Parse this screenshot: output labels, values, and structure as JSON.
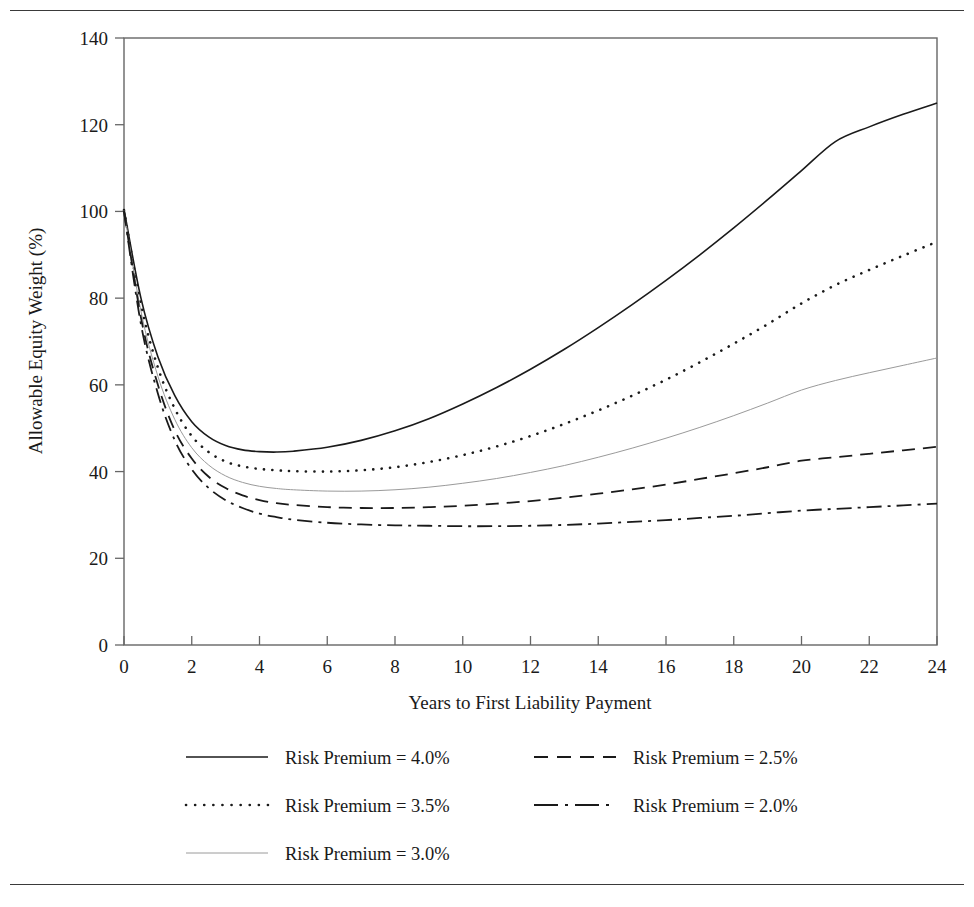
{
  "figure": {
    "background": "#ffffff",
    "frame_color": "#555555",
    "has_top_rule": true,
    "has_bottom_rule": true
  },
  "chart_data": {
    "type": "line",
    "title": "",
    "subtitle": "",
    "xlabel": "Years to First Liability Payment",
    "ylabel": "Allowable Equity Weight (%)",
    "xlim": [
      0,
      24
    ],
    "ylim": [
      0,
      140
    ],
    "xticks": [
      0,
      2,
      4,
      6,
      8,
      10,
      12,
      14,
      16,
      18,
      20,
      22,
      24
    ],
    "yticks": [
      0,
      20,
      40,
      60,
      80,
      100,
      120,
      140
    ],
    "xtick_labels": [
      "0",
      "2",
      "4",
      "6",
      "8",
      "10",
      "12",
      "14",
      "16",
      "18",
      "20",
      "22",
      "24"
    ],
    "ytick_labels": [
      "0",
      "20",
      "40",
      "60",
      "80",
      "100",
      "120",
      "140"
    ],
    "grid": false,
    "legend_position": "below-axes",
    "x": [
      0,
      0.5,
      1,
      1.5,
      2,
      2.5,
      3,
      3.5,
      4,
      4.5,
      5,
      6,
      7,
      8,
      9,
      10,
      11,
      12,
      13,
      14,
      15,
      16,
      17,
      18,
      19,
      20,
      21,
      22,
      23,
      24
    ],
    "series": [
      {
        "name": "Risk Premium = 4.0%",
        "style": "solid",
        "color": "#1a1a1a",
        "width": 1.6,
        "values": [
          100.5,
          80.0,
          66.5,
          57.5,
          51.5,
          48.0,
          46.0,
          45.0,
          44.6,
          44.5,
          44.7,
          45.6,
          47.2,
          49.4,
          52.2,
          55.6,
          59.4,
          63.6,
          68.2,
          73.2,
          78.5,
          84.1,
          90.0,
          96.2,
          102.7,
          109.4,
          116.1,
          119.5,
          122.4,
          125.0
        ]
      },
      {
        "name": "Risk Premium = 3.5%",
        "style": "dotted",
        "color": "#1a1a1a",
        "width": 2.6,
        "values": [
          100.3,
          78.5,
          64.0,
          54.5,
          48.2,
          44.5,
          42.3,
          41.2,
          40.6,
          40.3,
          40.1,
          40.0,
          40.3,
          41.0,
          42.2,
          43.8,
          45.8,
          48.2,
          51.0,
          54.1,
          57.5,
          61.2,
          65.2,
          69.5,
          74.0,
          78.8,
          83.0,
          86.5,
          89.8,
          93.0
        ]
      },
      {
        "name": "Risk Premium = 3.0%",
        "style": "solid-thin",
        "color": "#9a9a9a",
        "width": 1.0,
        "values": [
          100.2,
          77.0,
          62.0,
          52.0,
          45.5,
          41.5,
          39.0,
          37.5,
          36.6,
          36.1,
          35.8,
          35.5,
          35.5,
          35.8,
          36.4,
          37.3,
          38.4,
          39.8,
          41.4,
          43.3,
          45.4,
          47.7,
          50.2,
          52.9,
          55.8,
          58.8,
          61.0,
          62.8,
          64.5,
          66.2
        ]
      },
      {
        "name": "Risk Premium = 2.5%",
        "style": "dashed",
        "color": "#1a1a1a",
        "width": 1.8,
        "values": [
          100.1,
          75.5,
          60.0,
          49.5,
          43.0,
          38.8,
          36.2,
          34.5,
          33.4,
          32.7,
          32.3,
          31.8,
          31.6,
          31.6,
          31.8,
          32.1,
          32.6,
          33.2,
          34.0,
          34.9,
          35.9,
          37.0,
          38.3,
          39.6,
          41.0,
          42.5,
          43.3,
          44.1,
          44.9,
          45.7
        ]
      },
      {
        "name": "Risk Premium = 2.0%",
        "style": "dashdot",
        "color": "#1a1a1a",
        "width": 1.8,
        "values": [
          100.0,
          74.0,
          58.0,
          47.2,
          40.5,
          36.2,
          33.4,
          31.6,
          30.3,
          29.5,
          28.9,
          28.2,
          27.8,
          27.6,
          27.5,
          27.4,
          27.4,
          27.5,
          27.7,
          28.0,
          28.4,
          28.8,
          29.3,
          29.8,
          30.4,
          31.0,
          31.4,
          31.8,
          32.2,
          32.6
        ]
      }
    ]
  },
  "legend": {
    "entries": [
      {
        "label": "Risk Premium = 4.0%",
        "style": "solid"
      },
      {
        "label": "Risk Premium = 2.5%",
        "style": "dashed"
      },
      {
        "label": "Risk Premium = 3.5%",
        "style": "dotted"
      },
      {
        "label": "Risk Premium = 2.0%",
        "style": "dashdot"
      },
      {
        "label": "Risk Premium = 3.0%",
        "style": "solid-thin"
      }
    ]
  }
}
